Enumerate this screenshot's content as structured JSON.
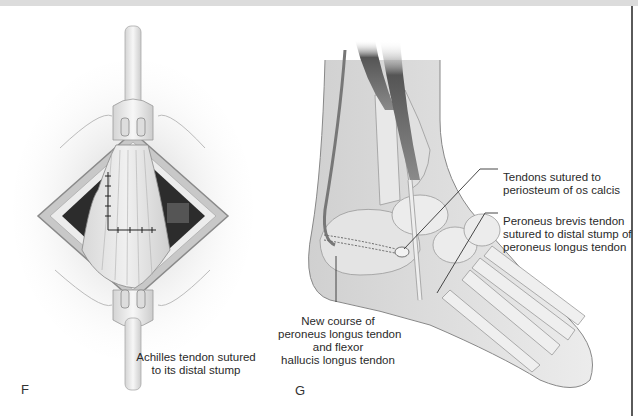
{
  "figure": {
    "panels": [
      {
        "id": "F",
        "letter": "F",
        "caption_lines": [
          "Achilles tendon sutured",
          "to its distal stump"
        ]
      },
      {
        "id": "G",
        "letter": "G",
        "callouts": [
          {
            "name": "tendons-sutured",
            "lines": [
              "Tendons sutured to",
              "periosteum of os calcis"
            ]
          },
          {
            "name": "peroneus-brevis",
            "lines": [
              "Peroneus brevis tendon",
              "sutured to distal stump of",
              "peroneus longus tendon"
            ]
          },
          {
            "name": "new-course",
            "lines": [
              "New course of",
              "peroneus longus tendon",
              "and flexor",
              "hallucis longus tendon"
            ]
          }
        ]
      }
    ],
    "colors": {
      "line": "#333333",
      "tissue_dark": "#3a3a3a",
      "tissue_mid": "#bdbdbd",
      "tissue_light": "#e8e8e8",
      "frame": "#5a5a5a"
    }
  }
}
